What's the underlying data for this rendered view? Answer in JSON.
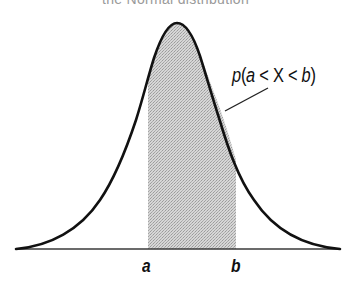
{
  "figure": {
    "title": "the Normal distribution",
    "title_clipped": true,
    "area_label": {
      "p": "p",
      "open": "(",
      "a": "a",
      "lt1": " < ",
      "X": "X",
      "lt2": " < ",
      "b": "b",
      "close": ")",
      "full_text": "p(a < X < b)"
    },
    "x_labels": {
      "a": "a",
      "b": "b"
    },
    "colors": {
      "curve": "#111111",
      "axis": "#333333",
      "shading": "#c8c8c8",
      "background": "#ffffff"
    }
  }
}
